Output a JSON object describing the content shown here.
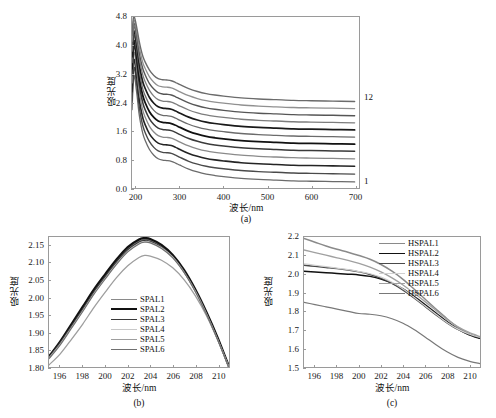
{
  "figure": {
    "background": "#ffffff",
    "axis_color": "#9a9a9a"
  },
  "panel_a": {
    "caption": "(a)",
    "xlabel": "波长/nm",
    "ylabel": "吸光度",
    "xticks": [
      "200",
      "300",
      "400",
      "500",
      "600",
      "700"
    ],
    "yticks": [
      "0.0",
      "0.8",
      "1.6",
      "2.4",
      "3.2",
      "4.0",
      "4.8"
    ],
    "top_series_label": "12",
    "bottom_series_label": "1"
  },
  "panel_b": {
    "caption": "(b)",
    "xlabel": "波长/nm",
    "ylabel": "吸光度",
    "xticks": [
      "196",
      "198",
      "200",
      "202",
      "204",
      "206",
      "208",
      "210"
    ],
    "yticks": [
      "1.80",
      "1.85",
      "1.90",
      "1.95",
      "2.00",
      "2.05",
      "2.10",
      "2.15"
    ],
    "legend": [
      {
        "label": "SPAL1",
        "color": "#8a8a8a",
        "width": 1.4
      },
      {
        "label": "SPAL2",
        "color": "#111111",
        "width": 2.2
      },
      {
        "label": "SPAL3",
        "color": "#3a3a3a",
        "width": 1.6
      },
      {
        "label": "SPAL4",
        "color": "#c8c8c8",
        "width": 1.2
      },
      {
        "label": "SPAL5",
        "color": "#9e9e9e",
        "width": 1.3
      },
      {
        "label": "SPAL6",
        "color": "#707070",
        "width": 1.2
      }
    ]
  },
  "panel_c": {
    "caption": "(c)",
    "xlabel": "波长/nm",
    "ylabel": "吸光度",
    "xticks": [
      "196",
      "198",
      "200",
      "202",
      "204",
      "206",
      "208",
      "210"
    ],
    "yticks": [
      "1.5",
      "1.6",
      "1.7",
      "1.8",
      "1.9",
      "2.0",
      "2.1",
      "2.2"
    ],
    "legend": [
      {
        "label": "HSPAL1",
        "color": "#8a8a8a",
        "width": 1.5
      },
      {
        "label": "HSPAL2",
        "color": "#111111",
        "width": 1.5
      },
      {
        "label": "HSPAL3",
        "color": "#4a4a4a",
        "width": 1.4
      },
      {
        "label": "HSPAL4",
        "color": "#d0d0d0",
        "width": 1.2
      },
      {
        "label": "HSPAL5",
        "color": "#a0a0a0",
        "width": 1.3
      },
      {
        "label": "HSPAL6",
        "color": "#787878",
        "width": 1.2
      }
    ]
  },
  "chart_data": [
    {
      "type": "line",
      "panel": "a",
      "title": "",
      "xlabel": "波长/nm",
      "ylabel": "吸光度",
      "xlim": [
        190,
        710
      ],
      "ylim": [
        0.0,
        4.8
      ],
      "xticks": [
        200,
        300,
        400,
        500,
        600,
        700
      ],
      "yticks": [
        0.0,
        0.8,
        1.6,
        2.4,
        3.2,
        4.0,
        4.8
      ],
      "grid": false,
      "legend": "none",
      "annotations": [
        {
          "text": "12",
          "x": 705,
          "y": 2.45
        },
        {
          "text": "1",
          "x": 705,
          "y": 0.17
        }
      ],
      "x": [
        190,
        193,
        196,
        199,
        202,
        206,
        210,
        215,
        220,
        230,
        240,
        250,
        260,
        270,
        280,
        290,
        300,
        320,
        340,
        360,
        380,
        400,
        440,
        480,
        520,
        560,
        600,
        650,
        700
      ],
      "series": [
        {
          "name": "1",
          "color": "#6b6b6b",
          "width": 1.3,
          "values": [
            2.2,
            2.95,
            3.15,
            2.85,
            2.55,
            2.1,
            1.8,
            1.52,
            1.34,
            1.08,
            0.92,
            0.82,
            0.78,
            0.77,
            0.75,
            0.7,
            0.64,
            0.53,
            0.45,
            0.39,
            0.35,
            0.32,
            0.27,
            0.24,
            0.22,
            0.2,
            0.19,
            0.18,
            0.17
          ]
        },
        {
          "name": "2",
          "color": "#4a4a4a",
          "width": 1.4,
          "values": [
            2.45,
            3.2,
            3.38,
            3.08,
            2.78,
            2.33,
            2.02,
            1.74,
            1.56,
            1.3,
            1.14,
            1.04,
            1.0,
            0.99,
            0.97,
            0.92,
            0.86,
            0.75,
            0.67,
            0.61,
            0.57,
            0.54,
            0.49,
            0.46,
            0.44,
            0.42,
            0.41,
            0.4,
            0.39
          ]
        },
        {
          "name": "3",
          "color": "#242424",
          "width": 1.6,
          "values": [
            2.7,
            3.45,
            3.6,
            3.3,
            3.0,
            2.55,
            2.24,
            1.96,
            1.78,
            1.52,
            1.36,
            1.26,
            1.22,
            1.21,
            1.19,
            1.14,
            1.08,
            0.97,
            0.89,
            0.83,
            0.79,
            0.76,
            0.71,
            0.68,
            0.66,
            0.64,
            0.63,
            0.62,
            0.61
          ]
        },
        {
          "name": "4",
          "color": "#8a8a8a",
          "width": 1.3,
          "values": [
            2.95,
            3.65,
            3.8,
            3.5,
            3.2,
            2.76,
            2.45,
            2.17,
            1.99,
            1.73,
            1.57,
            1.47,
            1.43,
            1.42,
            1.4,
            1.35,
            1.29,
            1.18,
            1.1,
            1.04,
            1.0,
            0.97,
            0.92,
            0.89,
            0.87,
            0.85,
            0.84,
            0.83,
            0.82
          ]
        },
        {
          "name": "5",
          "color": "#3a3a3a",
          "width": 1.5,
          "values": [
            3.15,
            3.85,
            3.98,
            3.7,
            3.4,
            2.97,
            2.66,
            2.38,
            2.2,
            1.94,
            1.78,
            1.68,
            1.64,
            1.63,
            1.61,
            1.56,
            1.5,
            1.39,
            1.31,
            1.25,
            1.21,
            1.18,
            1.13,
            1.1,
            1.08,
            1.06,
            1.05,
            1.04,
            1.03
          ]
        },
        {
          "name": "6",
          "color": "#111111",
          "width": 1.8,
          "values": [
            3.35,
            4.02,
            4.12,
            3.86,
            3.58,
            3.16,
            2.86,
            2.58,
            2.4,
            2.14,
            1.98,
            1.88,
            1.84,
            1.83,
            1.81,
            1.76,
            1.7,
            1.59,
            1.51,
            1.45,
            1.41,
            1.38,
            1.33,
            1.3,
            1.28,
            1.26,
            1.25,
            1.24,
            1.23
          ]
        },
        {
          "name": "7",
          "color": "#6b6b6b",
          "width": 1.3,
          "values": [
            3.52,
            4.18,
            4.26,
            4.0,
            3.74,
            3.34,
            3.05,
            2.77,
            2.6,
            2.34,
            2.18,
            2.08,
            2.04,
            2.03,
            2.01,
            1.96,
            1.9,
            1.79,
            1.71,
            1.65,
            1.61,
            1.58,
            1.53,
            1.5,
            1.48,
            1.46,
            1.45,
            1.44,
            1.43
          ]
        },
        {
          "name": "8",
          "color": "#1a1a1a",
          "width": 1.7,
          "values": [
            3.68,
            4.32,
            4.38,
            4.14,
            3.9,
            3.52,
            3.24,
            2.97,
            2.8,
            2.54,
            2.38,
            2.28,
            2.24,
            2.23,
            2.21,
            2.16,
            2.1,
            1.99,
            1.91,
            1.85,
            1.81,
            1.78,
            1.73,
            1.7,
            1.68,
            1.66,
            1.65,
            1.64,
            1.63
          ]
        },
        {
          "name": "9",
          "color": "#7d7d7d",
          "width": 1.3,
          "values": [
            3.84,
            4.45,
            4.5,
            4.28,
            4.05,
            3.69,
            3.42,
            3.16,
            2.99,
            2.74,
            2.58,
            2.48,
            2.44,
            2.43,
            2.41,
            2.36,
            2.3,
            2.19,
            2.11,
            2.05,
            2.01,
            1.98,
            1.93,
            1.9,
            1.88,
            1.86,
            1.85,
            1.84,
            1.83
          ]
        },
        {
          "name": "10",
          "color": "#565656",
          "width": 1.4,
          "values": [
            3.98,
            4.56,
            4.6,
            4.4,
            4.18,
            3.85,
            3.59,
            3.34,
            3.18,
            2.93,
            2.78,
            2.68,
            2.64,
            2.63,
            2.61,
            2.56,
            2.5,
            2.39,
            2.31,
            2.25,
            2.21,
            2.18,
            2.13,
            2.1,
            2.08,
            2.06,
            2.05,
            2.04,
            2.03
          ]
        },
        {
          "name": "11",
          "color": "#909090",
          "width": 1.3,
          "values": [
            4.12,
            4.66,
            4.69,
            4.51,
            4.3,
            4.0,
            3.75,
            3.51,
            3.36,
            3.12,
            2.97,
            2.87,
            2.84,
            2.83,
            2.81,
            2.76,
            2.7,
            2.59,
            2.51,
            2.45,
            2.41,
            2.38,
            2.33,
            2.3,
            2.28,
            2.26,
            2.25,
            2.24,
            2.23
          ]
        },
        {
          "name": "12",
          "color": "#6b6b6b",
          "width": 1.4,
          "values": [
            4.28,
            4.76,
            4.78,
            4.62,
            4.43,
            4.15,
            3.92,
            3.69,
            3.54,
            3.31,
            3.16,
            3.07,
            3.04,
            3.03,
            3.01,
            2.96,
            2.9,
            2.79,
            2.71,
            2.65,
            2.61,
            2.58,
            2.53,
            2.5,
            2.48,
            2.46,
            2.45,
            2.44,
            2.43
          ]
        }
      ]
    },
    {
      "type": "line",
      "panel": "b",
      "title": "",
      "xlabel": "波长/nm",
      "ylabel": "吸光度",
      "xlim": [
        195,
        211
      ],
      "ylim": [
        1.8,
        2.175
      ],
      "xticks": [
        196,
        198,
        200,
        202,
        204,
        206,
        208,
        210
      ],
      "yticks": [
        1.8,
        1.85,
        1.9,
        1.95,
        2.0,
        2.05,
        2.1,
        2.15
      ],
      "grid": false,
      "legend": "inside-bottom-center",
      "x": [
        195,
        196,
        197,
        198,
        199,
        200,
        201,
        202,
        203,
        203.5,
        204,
        205,
        206,
        207,
        208,
        209,
        210,
        211
      ],
      "series": [
        {
          "name": "SPAL1",
          "color": "#8a8a8a",
          "width": 1.4,
          "values": [
            1.832,
            1.872,
            1.92,
            1.968,
            2.018,
            2.062,
            2.104,
            2.14,
            2.163,
            2.168,
            2.165,
            2.148,
            2.12,
            2.077,
            2.022,
            1.956,
            1.882,
            1.8
          ]
        },
        {
          "name": "SPAL2",
          "color": "#111111",
          "width": 2.2,
          "values": [
            1.83,
            1.874,
            1.924,
            1.974,
            2.024,
            2.068,
            2.11,
            2.146,
            2.168,
            2.172,
            2.169,
            2.152,
            2.123,
            2.08,
            2.024,
            1.958,
            1.884,
            1.801
          ]
        },
        {
          "name": "SPAL3",
          "color": "#3a3a3a",
          "width": 1.6,
          "values": [
            1.828,
            1.87,
            1.918,
            1.966,
            2.016,
            2.06,
            2.102,
            2.138,
            2.16,
            2.165,
            2.162,
            2.146,
            2.118,
            2.075,
            2.02,
            1.954,
            1.88,
            1.799
          ]
        },
        {
          "name": "SPAL4",
          "color": "#c8c8c8",
          "width": 1.2,
          "values": [
            1.826,
            1.866,
            1.914,
            1.962,
            2.012,
            2.056,
            2.098,
            2.134,
            2.157,
            2.162,
            2.16,
            2.144,
            2.117,
            2.074,
            2.019,
            1.953,
            1.879,
            1.798
          ]
        },
        {
          "name": "SPAL5",
          "color": "#9e9e9e",
          "width": 1.3,
          "values": [
            1.806,
            1.838,
            1.88,
            1.924,
            1.972,
            2.016,
            2.058,
            2.092,
            2.116,
            2.122,
            2.12,
            2.108,
            2.086,
            2.052,
            2.006,
            1.948,
            1.878,
            1.8
          ]
        },
        {
          "name": "SPAL6",
          "color": "#707070",
          "width": 1.2,
          "values": [
            1.824,
            1.864,
            1.912,
            1.96,
            2.01,
            2.054,
            2.096,
            2.132,
            2.155,
            2.16,
            2.158,
            2.142,
            2.115,
            2.073,
            2.018,
            1.952,
            1.878,
            1.798
          ]
        }
      ]
    },
    {
      "type": "line",
      "panel": "c",
      "title": "",
      "xlabel": "波长/nm",
      "ylabel": "吸光度",
      "xlim": [
        195,
        211
      ],
      "ylim": [
        1.5,
        2.2
      ],
      "xticks": [
        196,
        198,
        200,
        202,
        204,
        206,
        208,
        210
      ],
      "yticks": [
        1.5,
        1.6,
        1.7,
        1.8,
        1.9,
        2.0,
        2.1,
        2.2
      ],
      "grid": false,
      "legend": "inside-top-right",
      "x": [
        195,
        196,
        197,
        198,
        199,
        200,
        201,
        202,
        203,
        204,
        205,
        206,
        207,
        208,
        209,
        210,
        211
      ],
      "series": [
        {
          "name": "HSPAL1",
          "color": "#8a8a8a",
          "width": 1.5,
          "values": [
            2.192,
            2.172,
            2.152,
            2.134,
            2.118,
            2.1,
            2.08,
            2.052,
            2.016,
            1.972,
            1.92,
            1.866,
            1.812,
            1.76,
            1.714,
            1.68,
            1.658
          ]
        },
        {
          "name": "HSPAL2",
          "color": "#111111",
          "width": 1.5,
          "values": [
            2.016,
            2.012,
            2.008,
            2.004,
            2.0,
            1.996,
            1.988,
            1.974,
            1.952,
            1.92,
            1.88,
            1.836,
            1.79,
            1.744,
            1.704,
            1.674,
            1.654
          ]
        },
        {
          "name": "HSPAL3",
          "color": "#4a4a4a",
          "width": 1.4,
          "values": [
            2.048,
            2.042,
            2.036,
            2.03,
            2.022,
            2.012,
            1.998,
            1.978,
            1.95,
            1.914,
            1.872,
            1.826,
            1.78,
            1.738,
            1.702,
            1.676,
            1.658
          ]
        },
        {
          "name": "HSPAL4",
          "color": "#d0d0d0",
          "width": 1.2,
          "values": [
            2.056,
            2.048,
            2.04,
            2.032,
            2.024,
            2.014,
            2.002,
            1.984,
            1.956,
            1.92,
            1.876,
            1.83,
            1.784,
            1.74,
            1.704,
            1.678,
            1.66
          ]
        },
        {
          "name": "HSPAL5",
          "color": "#a0a0a0",
          "width": 1.3,
          "values": [
            2.13,
            2.116,
            2.102,
            2.088,
            2.074,
            2.058,
            2.038,
            2.012,
            1.98,
            1.942,
            1.898,
            1.852,
            1.804,
            1.756,
            1.716,
            1.686,
            1.664
          ]
        },
        {
          "name": "HSPAL6",
          "color": "#787878",
          "width": 1.2,
          "values": [
            1.848,
            1.836,
            1.824,
            1.812,
            1.8,
            1.788,
            1.784,
            1.776,
            1.76,
            1.736,
            1.702,
            1.662,
            1.62,
            1.582,
            1.552,
            1.532,
            1.518
          ]
        }
      ]
    }
  ]
}
